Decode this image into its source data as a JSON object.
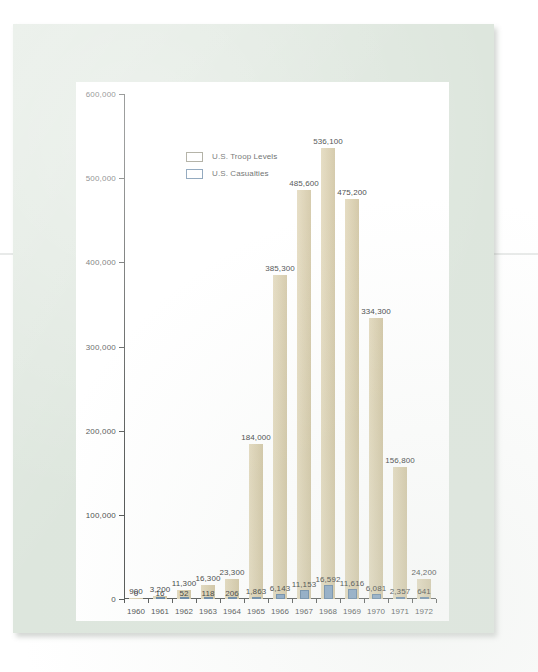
{
  "legend": {
    "items": [
      {
        "label": "U.S. Troop Levels",
        "color": "#d9cca6"
      },
      {
        "label": "U.S. Casualties",
        "color": "#7f9fbf"
      }
    ]
  },
  "axis": {
    "y_ticks": [
      "600,000",
      "500,000",
      "400,000",
      "300,000",
      "200,000",
      "100,000",
      "0"
    ],
    "x_ticks": [
      "1960",
      "1961",
      "1962",
      "1963",
      "1964",
      "1965",
      "1966",
      "1967",
      "1968",
      "1969",
      "1970",
      "1971",
      "1972"
    ]
  },
  "chart_data": {
    "type": "bar",
    "title": "",
    "xlabel": "",
    "ylabel": "",
    "ylim": [
      0,
      600000
    ],
    "grid": false,
    "legend_position": "top-left",
    "categories": [
      "1960",
      "1961",
      "1962",
      "1963",
      "1964",
      "1965",
      "1966",
      "1967",
      "1968",
      "1969",
      "1970",
      "1971",
      "1972"
    ],
    "series": [
      {
        "name": "U.S. Troop Levels",
        "color": "#d9cca6",
        "values": [
          900,
          3200,
          11300,
          16300,
          23300,
          184000,
          385300,
          485600,
          536100,
          475200,
          334300,
          156800,
          24200
        ],
        "labels": [
          "900",
          "3,200",
          "11,300",
          "16,300",
          "23,300",
          "184,000",
          "385,300",
          "485,600",
          "536,100",
          "475,200",
          "334,300",
          "156,800",
          "24,200"
        ]
      },
      {
        "name": "U.S. Casualties",
        "color": "#7f9fbf",
        "values": [
          0,
          16,
          52,
          118,
          206,
          1863,
          6143,
          11153,
          16592,
          11616,
          6081,
          2357,
          641
        ],
        "labels": [
          "0",
          "16",
          "52",
          "118",
          "206",
          "1,863",
          "6,143",
          "11,153",
          "16,592",
          "11,616",
          "6,081",
          "2,357",
          "641"
        ]
      }
    ]
  }
}
